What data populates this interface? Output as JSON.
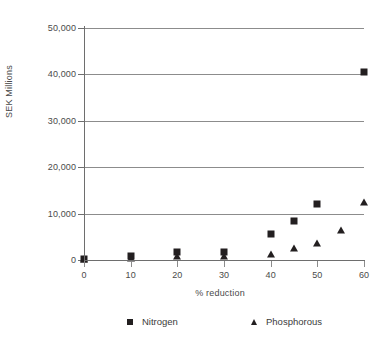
{
  "chart_data": {
    "type": "scatter",
    "title": "",
    "xlabel": "% reduction",
    "ylabel": "SEK Millions",
    "xlim": [
      0,
      60
    ],
    "ylim": [
      0,
      50000
    ],
    "grid": true,
    "legend_position": "bottom",
    "x_ticks": [
      0,
      10,
      20,
      30,
      40,
      50,
      60
    ],
    "x_tick_labels": [
      "0",
      "10",
      "20",
      "30",
      "40",
      "50",
      "60"
    ],
    "y_ticks": [
      0,
      10000,
      20000,
      30000,
      40000,
      50000
    ],
    "y_tick_labels": [
      "0",
      "10,000",
      "20,000",
      "30,000",
      "40,000",
      "50,000"
    ],
    "marker_color": "#231f20",
    "gridline_color": "#8c8c8c",
    "axis_color": "#6e6e6e",
    "series": [
      {
        "name": "Nitrogen",
        "marker": "square",
        "points": [
          {
            "x": 0,
            "y": 300
          },
          {
            "x": 10,
            "y": 800
          },
          {
            "x": 20,
            "y": 1700
          },
          {
            "x": 30,
            "y": 1800
          },
          {
            "x": 40,
            "y": 5700
          },
          {
            "x": 45,
            "y": 8400
          },
          {
            "x": 50,
            "y": 12100
          },
          {
            "x": 60,
            "y": 40500
          }
        ]
      },
      {
        "name": "Phosphorous",
        "marker": "triangle",
        "points": [
          {
            "x": 0,
            "y": 200
          },
          {
            "x": 10,
            "y": 400
          },
          {
            "x": 20,
            "y": 900
          },
          {
            "x": 30,
            "y": 800
          },
          {
            "x": 40,
            "y": 1400
          },
          {
            "x": 45,
            "y": 2600
          },
          {
            "x": 50,
            "y": 3600
          },
          {
            "x": 55,
            "y": 6500
          },
          {
            "x": 60,
            "y": 12600
          }
        ]
      }
    ]
  },
  "legend": {
    "items": [
      {
        "label": "Nitrogen",
        "marker": "square"
      },
      {
        "label": "Phosphorous",
        "marker": "triangle"
      }
    ]
  },
  "axes": {
    "y_title": "SEK Millions",
    "x_title": "% reduction"
  }
}
